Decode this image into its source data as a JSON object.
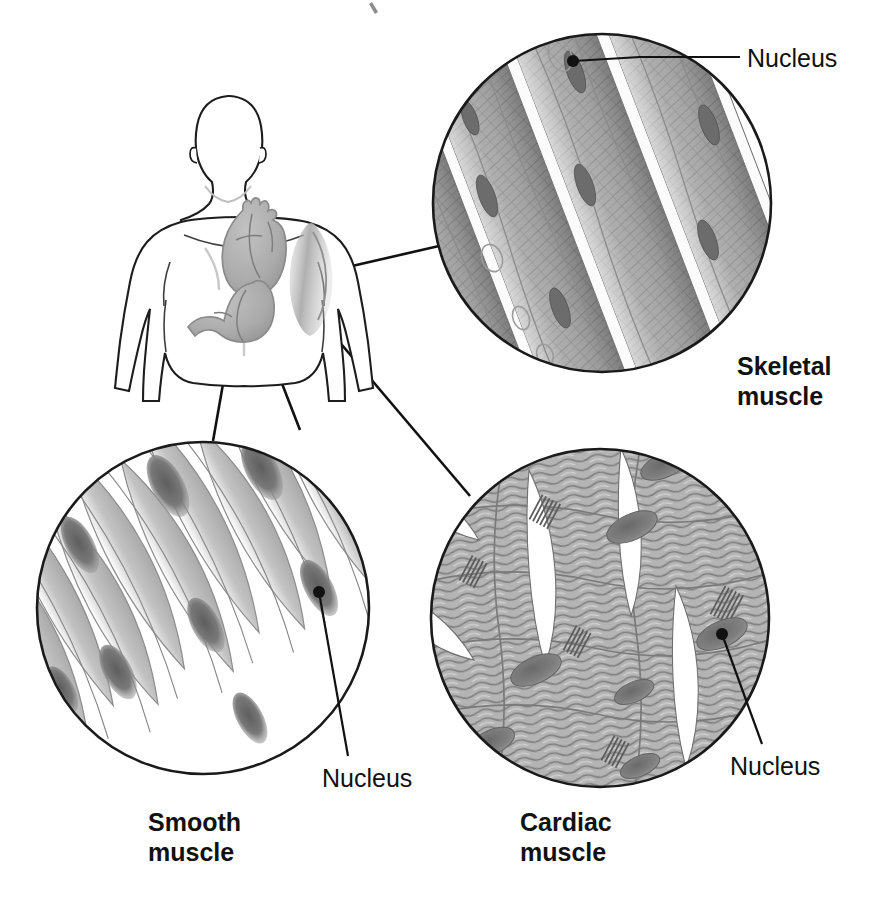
{
  "figure": {
    "background_color": "#ffffff",
    "width": 878,
    "height": 911,
    "line_color": "#111111",
    "ink": {
      "outline": "#1a1a1a",
      "fiber_mid": "#a8a8a8",
      "fiber_light": "#cfcfcf",
      "fiber_dark": "#8a8a8a",
      "nucleus": "#6e6e6e",
      "nucleus_dark": "#5a5a5a",
      "organ_fill": "#b0b0b0",
      "white": "#ffffff"
    }
  },
  "labels": {
    "nucleus_skeletal": "Nucleus",
    "nucleus_smooth": "Nucleus",
    "nucleus_cardiac": "Nucleus",
    "skeletal_line1": "Skeletal",
    "skeletal_line2": "muscle",
    "smooth_line1": "Smooth",
    "smooth_line2": "muscle",
    "cardiac_line1": "Cardiac",
    "cardiac_line2": "muscle"
  },
  "panels": [
    {
      "id": "skeletal",
      "name": "Skeletal muscle",
      "label_lines": [
        "Skeletal",
        "muscle"
      ],
      "circle": {
        "cx": 602,
        "cy": 203,
        "r": 170
      },
      "tissue": "long parallel multinucleated striated fibers with peripheral nuclei separated by pale endomysium bands",
      "nucleus_position": "peripheral",
      "striations": true,
      "branching": false,
      "body_origin": "arm skeletal muscle (biceps)",
      "leader_from": {
        "x": 326,
        "y": 272
      },
      "leader_to": {
        "x": 452,
        "y": 243
      }
    },
    {
      "id": "smooth",
      "name": "Smooth muscle",
      "label_lines": [
        "Smooth",
        "muscle"
      ],
      "circle": {
        "cx": 203,
        "cy": 608,
        "r": 167
      },
      "tissue": "spindle-shaped (fusiform) non-striated cells with single central oval nuclei",
      "nucleus_position": "central",
      "striations": false,
      "branching": false,
      "body_origin": "stomach wall",
      "leader_from": {
        "x": 236,
        "y": 310
      },
      "leader_to": {
        "x": 213,
        "y": 441
      }
    },
    {
      "id": "cardiac",
      "name": "Cardiac muscle",
      "label_lines": [
        "Cardiac",
        "muscle"
      ],
      "circle": {
        "cx": 600,
        "cy": 618,
        "r": 170
      },
      "tissue": "branching striated fibers joined by intercalated discs with central nuclei",
      "nucleus_position": "central",
      "striations": true,
      "branching": true,
      "intercalated_discs": true,
      "body_origin": "heart",
      "leader_from": {
        "x": 264,
        "y": 253
      },
      "leader_to": {
        "x": 470,
        "y": 496
      }
    }
  ],
  "body_figure": {
    "name": "human torso outline",
    "organs": [
      {
        "name": "heart",
        "marker": {
          "x": 264,
          "y": 253
        },
        "muscle_type": "cardiac"
      },
      {
        "name": "stomach",
        "marker": {
          "x": 236,
          "y": 310
        },
        "muscle_type": "smooth"
      },
      {
        "name": "arm muscle",
        "marker": {
          "x": 326,
          "y": 272
        },
        "muscle_type": "skeletal"
      }
    ]
  },
  "nucleus_callouts": [
    {
      "panel": "skeletal",
      "dot": {
        "x": 573,
        "y": 61
      },
      "elbow": {
        "x": 640,
        "y": 57
      },
      "end": {
        "x": 740,
        "y": 57
      }
    },
    {
      "panel": "smooth",
      "dot": {
        "x": 319,
        "y": 592
      },
      "end": {
        "x": 348,
        "y": 756
      }
    },
    {
      "panel": "cardiac",
      "dot": {
        "x": 722,
        "y": 634
      },
      "end": {
        "x": 762,
        "y": 744
      }
    }
  ]
}
